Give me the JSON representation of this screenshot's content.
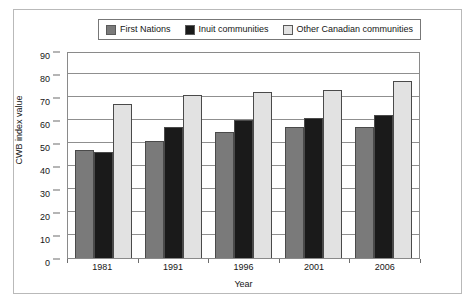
{
  "chart_data": {
    "type": "bar",
    "title": "",
    "xlabel": "Year",
    "ylabel": "CWB index value",
    "categories": [
      "1981",
      "1991",
      "1996",
      "2001",
      "2006"
    ],
    "series": [
      {
        "name": "First Nations",
        "values": [
          47,
          51,
          55,
          57,
          57
        ],
        "color": "#7a7a7a"
      },
      {
        "name": "Inuit communities",
        "values": [
          46,
          57,
          60,
          61,
          62
        ],
        "color": "#1a1a1a"
      },
      {
        "name": "Other Canadian communities",
        "values": [
          67,
          71,
          72,
          73,
          77
        ],
        "color": "#e2e2e2"
      }
    ],
    "ylim": [
      0,
      90
    ],
    "ytick_values": [
      0,
      10,
      20,
      30,
      40,
      50,
      60,
      70,
      80,
      90
    ],
    "ytick_labels": [
      "0",
      "10",
      "20",
      "30",
      "40",
      "50",
      "60",
      "70",
      "80",
      "90"
    ],
    "grid": true,
    "legend_position": "top-center"
  },
  "legend": {
    "entries": [
      {
        "label": "First Nations",
        "color": "#7a7a7a"
      },
      {
        "label": "Inuit communities",
        "color": "#1a1a1a"
      },
      {
        "label": "Other Canadian communities",
        "color": "#e2e2e2"
      }
    ]
  },
  "axes": {
    "x_title": "Year",
    "y_title": "CWB index value"
  }
}
